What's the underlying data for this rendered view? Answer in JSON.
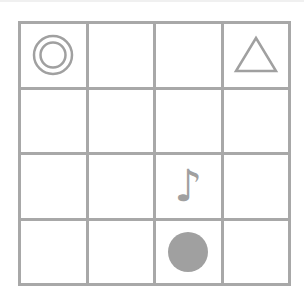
{
  "board": {
    "rows": 4,
    "cols": 4,
    "line_color": "#a8a8a8",
    "piece_color": "#a0a0a0",
    "cells": [
      [
        {
          "piece": "double-circle"
        },
        {
          "piece": ""
        },
        {
          "piece": ""
        },
        {
          "piece": "triangle"
        }
      ],
      [
        {
          "piece": ""
        },
        {
          "piece": ""
        },
        {
          "piece": ""
        },
        {
          "piece": ""
        }
      ],
      [
        {
          "piece": ""
        },
        {
          "piece": ""
        },
        {
          "piece": "music-note",
          "glyph": "♪"
        },
        {
          "piece": ""
        }
      ],
      [
        {
          "piece": ""
        },
        {
          "piece": ""
        },
        {
          "piece": "filled-circle"
        },
        {
          "piece": ""
        }
      ]
    ]
  }
}
